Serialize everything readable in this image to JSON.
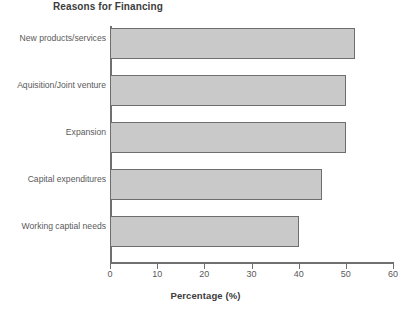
{
  "chart_data": {
    "type": "bar",
    "orientation": "horizontal",
    "title": "Reasons for Financing",
    "xlabel": "Percentage (%)",
    "ylabel": "",
    "categories": [
      "New products/services",
      "Aquisition/Joint venture",
      "Expansion",
      "Capital expenditures",
      "Working captial needs"
    ],
    "values": [
      52,
      50,
      50,
      45,
      40
    ],
    "xlim": [
      0,
      60
    ],
    "xticks": [
      0,
      10,
      20,
      30,
      40,
      50,
      60
    ],
    "xtick_labels": [
      "0",
      "10",
      "20",
      "30",
      "40",
      "50",
      "60"
    ],
    "grid": false,
    "legend": false,
    "bar_fill_color": "#c9c9c9",
    "bar_edge_color": "#6e6e6e",
    "axis_color": "#707070",
    "text_color": "#5a5a5a"
  }
}
